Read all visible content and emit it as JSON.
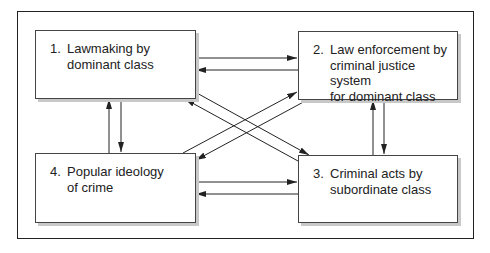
{
  "diagram": {
    "type": "flow-diagram",
    "nodes": [
      {
        "id": 1,
        "number": "1.",
        "lines": [
          "Lawmaking by",
          "dominant class"
        ]
      },
      {
        "id": 2,
        "number": "2.",
        "lines": [
          "Law enforcement by",
          "criminal justice system",
          "for dominant class"
        ]
      },
      {
        "id": 3,
        "number": "3.",
        "lines": [
          "Criminal acts by",
          "subordinate class"
        ]
      },
      {
        "id": 4,
        "number": "4.",
        "lines": [
          "Popular ideology",
          "of crime"
        ]
      }
    ],
    "edges": [
      {
        "from": 1,
        "to": 2
      },
      {
        "from": 2,
        "to": 1
      },
      {
        "from": 1,
        "to": 4
      },
      {
        "from": 4,
        "to": 1
      },
      {
        "from": 2,
        "to": 3
      },
      {
        "from": 3,
        "to": 2
      },
      {
        "from": 4,
        "to": 3
      },
      {
        "from": 3,
        "to": 4
      },
      {
        "from": 1,
        "to": 3
      },
      {
        "from": 3,
        "to": 1
      },
      {
        "from": 4,
        "to": 2
      },
      {
        "from": 2,
        "to": 4
      }
    ]
  }
}
